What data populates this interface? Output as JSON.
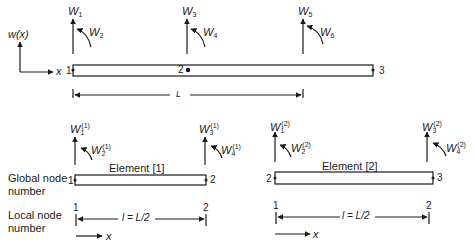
{
  "global": {
    "axis_label": "w(x)",
    "x_label": "x",
    "length_label": "L",
    "nodes": [
      "1",
      "2",
      "3"
    ],
    "dofs": [
      {
        "sym": "W",
        "sub": "1"
      },
      {
        "sym": "W",
        "sub": "2"
      },
      {
        "sym": "W",
        "sub": "3"
      },
      {
        "sym": "W",
        "sub": "4"
      },
      {
        "sym": "W",
        "sub": "5"
      },
      {
        "sym": "W",
        "sub": "6"
      }
    ]
  },
  "row_labels": {
    "global_node": "Global node number",
    "local_node": "Local node number"
  },
  "elements": [
    {
      "title": "Element [1]",
      "global_nodes": [
        "1",
        "2"
      ],
      "local_nodes": [
        "1",
        "2"
      ],
      "length_label": "l = L/2",
      "x_label": "x",
      "dofs": [
        {
          "sym": "W",
          "sub": "1",
          "sup": "(1)"
        },
        {
          "sym": "W",
          "sub": "2",
          "sup": "(1)"
        },
        {
          "sym": "W",
          "sub": "3",
          "sup": "(1)"
        },
        {
          "sym": "W",
          "sub": "4",
          "sup": "(1)"
        }
      ]
    },
    {
      "title": "Element [2]",
      "global_nodes": [
        "2",
        "3"
      ],
      "local_nodes": [
        "1",
        "2"
      ],
      "length_label": "l = L/2",
      "x_label": "x",
      "dofs": [
        {
          "sym": "W",
          "sub": "1",
          "sup": "(2)"
        },
        {
          "sym": "W",
          "sub": "2",
          "sup": "(2)"
        },
        {
          "sym": "W",
          "sub": "3",
          "sup": "(2)"
        },
        {
          "sym": "W",
          "sub": "4",
          "sup": "(2)"
        }
      ]
    }
  ]
}
